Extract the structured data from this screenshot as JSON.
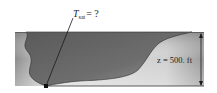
{
  "diagram": {
    "question_label": {
      "symbol": "T",
      "subscript": "sat",
      "suffix": "= ?"
    },
    "depth_label": "z = 500. ft",
    "colors": {
      "ground_light": "#e6e6e6",
      "ground_dark": "#9a9a9a",
      "water_dark": "#5e5e5e",
      "water_light": "#8c8c8c",
      "lines": "#1a1a1a"
    }
  }
}
